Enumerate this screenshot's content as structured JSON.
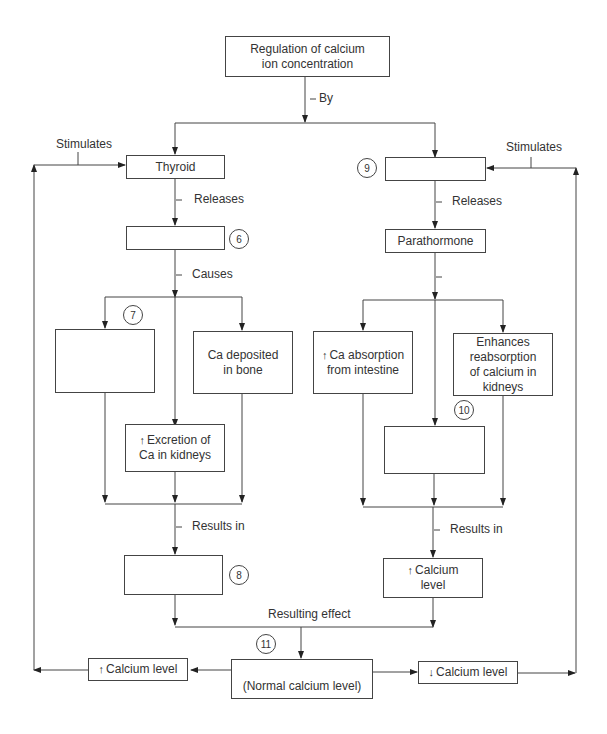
{
  "title_box": {
    "line1": "Regulation of calcium",
    "line2": "ion concentration"
  },
  "labels": {
    "by": "By",
    "stimulates_left": "Stimulates",
    "stimulates_right": "Stimulates",
    "releases_left": "Releases",
    "releases_right": "Releases",
    "causes": "Causes",
    "results_in_left": "Results in",
    "results_in_right": "Results in",
    "resulting_effect": "Resulting effect"
  },
  "left_branch": {
    "gland": "Thyroid",
    "hormone": "",
    "effect_7": "",
    "effect_bone": {
      "line1": "Ca deposited",
      "line2": "in bone"
    },
    "effect_kidney": {
      "arrow": "↑",
      "line1": "Excretion of",
      "line2": "Ca in kidneys"
    },
    "result_8": ""
  },
  "right_branch": {
    "gland_9": "",
    "hormone": "Parathormone",
    "effect_intestine": {
      "arrow": "↑",
      "line1": "Ca absorption",
      "line2": "from intestine"
    },
    "effect_kidney": {
      "line1": "Enhances",
      "line2": "reabsorption",
      "line3": "of calcium in",
      "line4": "kidneys"
    },
    "effect_10": "",
    "result": {
      "arrow": "↑",
      "line1": "Calcium",
      "line2": "level"
    }
  },
  "bottom": {
    "normal": "(Normal calcium level)",
    "high": {
      "arrow": "↑",
      "text": "Calcium level"
    },
    "low": {
      "arrow": "↓",
      "text": "Calcium level"
    }
  },
  "numbers": {
    "n6": "6",
    "n7": "7",
    "n8": "8",
    "n9": "9",
    "n10": "10",
    "n11": "11"
  }
}
